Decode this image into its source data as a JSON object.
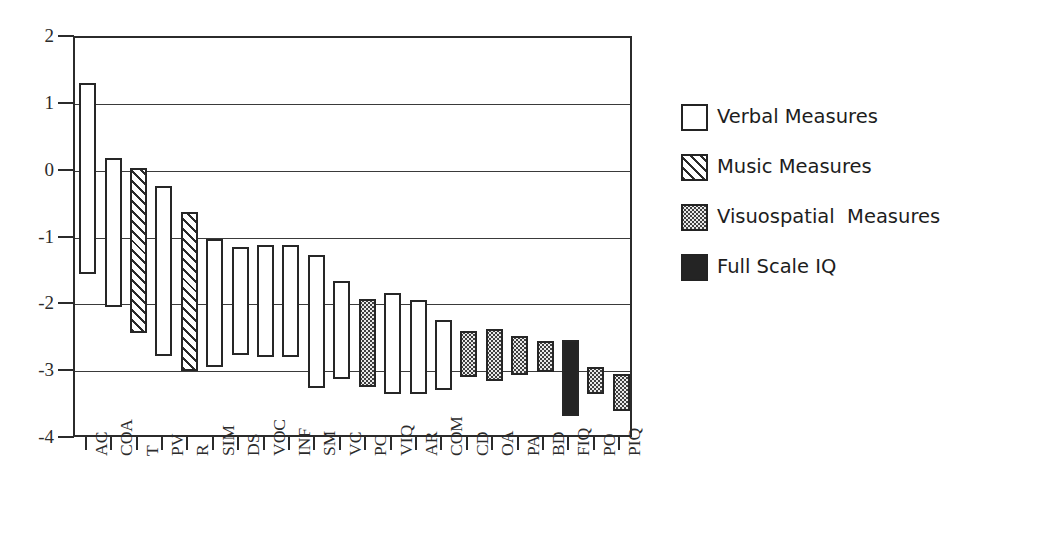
{
  "chart_data": {
    "type": "bar",
    "subtype": "floating-range-bar",
    "title": "",
    "subtitle": "",
    "xlabel": "",
    "ylabel": "",
    "ylim": [
      -4,
      2
    ],
    "yticks": [
      2,
      1,
      0,
      -1,
      -2,
      -3,
      -4
    ],
    "ytick_labels": [
      "2",
      "1",
      "0",
      "-1",
      "-2",
      "-3",
      "-4"
    ],
    "grid": true,
    "grid_axis": "y",
    "legend_position": "right",
    "categories": [
      "AC",
      "COA",
      "T",
      "PV",
      "R",
      "SIM",
      "DS",
      "VOC",
      "INF",
      "SM",
      "VC",
      "PC",
      "VIQ",
      "AR",
      "COM",
      "CD",
      "OA",
      "PA",
      "BD",
      "FIQ",
      "PO",
      "PIQ"
    ],
    "series": [
      {
        "name": "Verbal Measures",
        "fill": "white",
        "color": "#ffffff",
        "edge_color": "#262626"
      },
      {
        "name": "Music Measures",
        "fill": "diagonal-hatch",
        "color": "#ffffff",
        "edge_color": "#262626"
      },
      {
        "name": "Visuospatial  Measures",
        "fill": "stipple",
        "color": "#3f3f3f",
        "edge_color": "#262626"
      },
      {
        "name": "Full Scale IQ",
        "fill": "solid",
        "color": "#242424",
        "edge_color": "#262626"
      }
    ],
    "bars": [
      {
        "label": "AC",
        "group": "Verbal Measures",
        "top": 1.33,
        "bottom": -1.53
      },
      {
        "label": "COA",
        "group": "Verbal Measures",
        "top": 0.2,
        "bottom": -2.03
      },
      {
        "label": "T",
        "group": "Music Measures",
        "top": 0.05,
        "bottom": -2.42
      },
      {
        "label": "PV",
        "group": "Verbal Measures",
        "top": -0.22,
        "bottom": -2.76
      },
      {
        "label": "R",
        "group": "Music Measures",
        "top": -0.6,
        "bottom": -2.99
      },
      {
        "label": "SIM",
        "group": "Verbal Measures",
        "top": -1.0,
        "bottom": -2.92
      },
      {
        "label": "DS",
        "group": "Verbal Measures",
        "top": -1.12,
        "bottom": -2.75
      },
      {
        "label": "VOC",
        "group": "Verbal Measures",
        "top": -1.1,
        "bottom": -2.78
      },
      {
        "label": "INF",
        "group": "Verbal Measures",
        "top": -1.1,
        "bottom": -2.78
      },
      {
        "label": "SM",
        "group": "Verbal Measures",
        "top": -1.25,
        "bottom": -3.23
      },
      {
        "label": "VC",
        "group": "Verbal Measures",
        "top": -1.63,
        "bottom": -3.1
      },
      {
        "label": "PC",
        "group": "Visuospatial  Measures",
        "top": -1.9,
        "bottom": -3.22
      },
      {
        "label": "VIQ",
        "group": "Verbal Measures",
        "top": -1.82,
        "bottom": -3.33
      },
      {
        "label": "AR",
        "group": "Verbal Measures",
        "top": -1.92,
        "bottom": -3.33
      },
      {
        "label": "COM",
        "group": "Verbal Measures",
        "top": -2.22,
        "bottom": -3.27
      },
      {
        "label": "CD",
        "group": "Visuospatial  Measures",
        "top": -2.38,
        "bottom": -3.07
      },
      {
        "label": "OA",
        "group": "Visuospatial  Measures",
        "top": -2.35,
        "bottom": -3.13
      },
      {
        "label": "PA",
        "group": "Visuospatial  Measures",
        "top": -2.46,
        "bottom": -3.04
      },
      {
        "label": "BD",
        "group": "Visuospatial  Measures",
        "top": -2.53,
        "bottom": -3.0
      },
      {
        "label": "FIQ",
        "group": "Full Scale IQ",
        "top": -2.52,
        "bottom": -3.65
      },
      {
        "label": "PO",
        "group": "Visuospatial  Measures",
        "top": -2.92,
        "bottom": -3.32
      },
      {
        "label": "PIQ",
        "group": "Visuospatial  Measures",
        "top": -3.02,
        "bottom": -3.58
      }
    ]
  },
  "legend": {
    "items": [
      {
        "label": "Verbal Measures",
        "swatch": "swatch-white"
      },
      {
        "label": "Music Measures",
        "swatch": "swatch-hatch"
      },
      {
        "label": "Visuospatial  Measures",
        "swatch": "swatch-stipple"
      },
      {
        "label": "Full Scale IQ",
        "swatch": "swatch-solid"
      }
    ]
  }
}
